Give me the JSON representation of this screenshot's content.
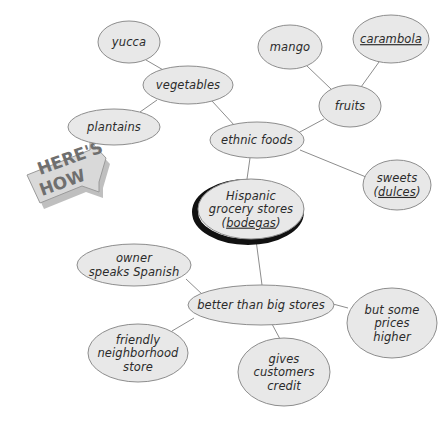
{
  "page": {
    "background_color": "#ffffff",
    "cropped_top_line": "grocery shopping in the neighborhood"
  },
  "banner": {
    "name": "here-s-how-banner",
    "line1": "HERE'S",
    "line2": "HOW",
    "fill_color": "#d9d9d9",
    "text_color": "#6f6f6f",
    "shadow_color": "#8a8a8a"
  },
  "style": {
    "node_fill": "#e8e8e8",
    "node_stroke": "#8d8d8d",
    "text_color": "#2b2b2b",
    "edge_color": "#8d8d8d",
    "center_shadow_color": "#111111"
  },
  "nodes": [
    {
      "id": "yucca",
      "lines": [
        "yucca"
      ],
      "underline": [],
      "cx": 129,
      "cy": 42,
      "rx": 31,
      "ry": 21,
      "emphasis": false
    },
    {
      "id": "vegetables",
      "lines": [
        "vegetables"
      ],
      "underline": [],
      "cx": 188,
      "cy": 85,
      "rx": 45,
      "ry": 19,
      "emphasis": false
    },
    {
      "id": "plantains",
      "lines": [
        "plantains"
      ],
      "underline": [],
      "cx": 114,
      "cy": 127,
      "rx": 46,
      "ry": 18,
      "emphasis": false
    },
    {
      "id": "mango",
      "lines": [
        "mango"
      ],
      "underline": [],
      "cx": 290,
      "cy": 47,
      "rx": 32,
      "ry": 22,
      "emphasis": false
    },
    {
      "id": "carambola",
      "lines": [
        "carambola"
      ],
      "underline": [
        "carambola"
      ],
      "cx": 391,
      "cy": 39,
      "rx": 38,
      "ry": 24,
      "emphasis": false
    },
    {
      "id": "fruits",
      "lines": [
        "fruits"
      ],
      "underline": [],
      "cx": 350,
      "cy": 106,
      "rx": 31,
      "ry": 21,
      "emphasis": false
    },
    {
      "id": "ethnic-foods",
      "lines": [
        "ethnic foods"
      ],
      "underline": [],
      "cx": 257,
      "cy": 140,
      "rx": 47,
      "ry": 18,
      "emphasis": false
    },
    {
      "id": "sweets",
      "lines": [
        "sweets",
        "(dulces)"
      ],
      "underline": [
        "dulces"
      ],
      "cx": 397,
      "cy": 185,
      "rx": 34,
      "ry": 25,
      "emphasis": false
    },
    {
      "id": "bodegas",
      "lines": [
        "Hispanic",
        "grocery stores",
        "(bodegas)"
      ],
      "underline": [
        "bodegas"
      ],
      "cx": 251,
      "cy": 209,
      "rx": 53,
      "ry": 30,
      "emphasis": true
    },
    {
      "id": "owner-spanish",
      "lines": [
        "owner",
        "speaks Spanish"
      ],
      "underline": [],
      "cx": 134,
      "cy": 265,
      "rx": 57,
      "ry": 21,
      "emphasis": false
    },
    {
      "id": "better-stores",
      "lines": [
        "better than big stores"
      ],
      "underline": [],
      "cx": 261,
      "cy": 305,
      "rx": 73,
      "ry": 20,
      "emphasis": false
    },
    {
      "id": "prices-higher",
      "lines": [
        "but some",
        "prices",
        "higher"
      ],
      "underline": [],
      "cx": 392,
      "cy": 323,
      "rx": 45,
      "ry": 35,
      "emphasis": false
    },
    {
      "id": "friendly-store",
      "lines": [
        "friendly",
        "neighborhood",
        "store"
      ],
      "underline": [],
      "cx": 138,
      "cy": 353,
      "rx": 50,
      "ry": 29,
      "emphasis": false
    },
    {
      "id": "gives-credit",
      "lines": [
        "gives",
        "customers",
        "credit"
      ],
      "underline": [],
      "cx": 284,
      "cy": 372,
      "rx": 46,
      "ry": 34,
      "emphasis": false
    }
  ],
  "edges": [
    {
      "from": "yucca",
      "to": "vegetables",
      "x1": 146,
      "y1": 60,
      "x2": 165,
      "y2": 71
    },
    {
      "from": "vegetables",
      "to": "plantains",
      "x1": 157,
      "y1": 100,
      "x2": 140,
      "y2": 112
    },
    {
      "from": "vegetables",
      "to": "ethnic-foods",
      "x1": 212,
      "y1": 101,
      "x2": 235,
      "y2": 126
    },
    {
      "from": "mango",
      "to": "fruits",
      "x1": 307,
      "y1": 66,
      "x2": 331,
      "y2": 89
    },
    {
      "from": "carambola",
      "to": "fruits",
      "x1": 379,
      "y1": 62,
      "x2": 361,
      "y2": 87
    },
    {
      "from": "fruits",
      "to": "ethnic-foods",
      "x1": 324,
      "y1": 119,
      "x2": 298,
      "y2": 133
    },
    {
      "from": "ethnic-foods",
      "to": "sweets",
      "x1": 300,
      "y1": 150,
      "x2": 366,
      "y2": 177
    },
    {
      "from": "ethnic-foods",
      "to": "bodegas",
      "x1": 250,
      "y1": 158,
      "x2": 247,
      "y2": 179
    },
    {
      "from": "bodegas",
      "to": "better-stores",
      "x1": 256,
      "y1": 240,
      "x2": 262,
      "y2": 285
    },
    {
      "from": "owner-spanish",
      "to": "better-stores",
      "x1": 186,
      "y1": 279,
      "x2": 203,
      "y2": 295
    },
    {
      "from": "better-stores",
      "to": "prices-higher",
      "x1": 333,
      "y1": 304,
      "x2": 348,
      "y2": 308
    },
    {
      "from": "better-stores",
      "to": "friendly-store",
      "x1": 194,
      "y1": 318,
      "x2": 172,
      "y2": 331
    },
    {
      "from": "better-stores",
      "to": "gives-credit",
      "x1": 272,
      "y1": 324,
      "x2": 280,
      "y2": 339
    }
  ]
}
